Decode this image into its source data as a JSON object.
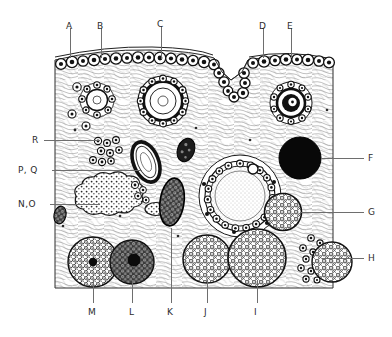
{
  "figure": {
    "kind": "histology-diagram",
    "title": "",
    "background_color": "#ffffff",
    "ink_color": "#1b1b1b",
    "leader_color": "#6e6e6e",
    "label_color": "#2b2b2b",
    "block": {
      "left": 55,
      "top": 52,
      "right": 333,
      "bottom": 288
    }
  },
  "labels": [
    {
      "id": "A",
      "text": "A",
      "x": 66,
      "y": 21,
      "leader": {
        "type": "v",
        "x": 70,
        "y1": 28,
        "y2": 58
      }
    },
    {
      "id": "B",
      "text": "B",
      "x": 97,
      "y": 21,
      "leader": {
        "type": "v",
        "x": 101,
        "y1": 28,
        "y2": 58
      }
    },
    {
      "id": "C",
      "text": "C",
      "x": 157,
      "y": 19,
      "leader": {
        "type": "v",
        "x": 161,
        "y1": 26,
        "y2": 59
      }
    },
    {
      "id": "D",
      "text": "D",
      "x": 259,
      "y": 21,
      "leader": {
        "type": "v",
        "x": 263,
        "y1": 28,
        "y2": 58
      }
    },
    {
      "id": "E",
      "text": "E",
      "x": 287,
      "y": 21,
      "leader": {
        "type": "v",
        "x": 291,
        "y1": 28,
        "y2": 58
      }
    },
    {
      "id": "F",
      "text": "F",
      "x": 368,
      "y": 153,
      "leader": {
        "type": "h",
        "x1": 321,
        "x2": 364,
        "y": 158
      }
    },
    {
      "id": "G",
      "text": "G",
      "x": 368,
      "y": 207,
      "leader": {
        "type": "h",
        "x1": 300,
        "x2": 364,
        "y": 212
      }
    },
    {
      "id": "H",
      "text": "H",
      "x": 368,
      "y": 253,
      "leader": {
        "type": "h",
        "x1": 322,
        "x2": 364,
        "y": 258
      }
    },
    {
      "id": "I",
      "text": "I",
      "x": 254,
      "y": 308,
      "leader": {
        "type": "v",
        "x": 257,
        "y1": 280,
        "y2": 303
      }
    },
    {
      "id": "J",
      "text": "J",
      "x": 204,
      "y": 308,
      "leader": {
        "type": "v",
        "x": 207,
        "y1": 280,
        "y2": 303
      }
    },
    {
      "id": "K",
      "text": "K",
      "x": 167,
      "y": 308,
      "leader": {
        "type": "v",
        "x": 171,
        "y1": 228,
        "y2": 303
      }
    },
    {
      "id": "L",
      "text": "L",
      "x": 129,
      "y": 308,
      "leader": {
        "type": "v",
        "x": 132,
        "y1": 280,
        "y2": 303
      }
    },
    {
      "id": "M",
      "text": "M",
      "x": 88,
      "y": 308,
      "leader": {
        "type": "v",
        "x": 93,
        "y1": 280,
        "y2": 303
      }
    },
    {
      "id": "N,O",
      "text": "N,O",
      "x": 18,
      "y": 199,
      "leader": {
        "type": "h",
        "x1": 50,
        "x2": 100,
        "y": 204
      }
    },
    {
      "id": "P,Q",
      "text": "P, Q",
      "x": 18,
      "y": 165,
      "leader": {
        "type": "h",
        "x1": 52,
        "x2": 142,
        "y": 170
      }
    },
    {
      "id": "R",
      "text": "R",
      "x": 32,
      "y": 135,
      "leader": {
        "type": "h",
        "x1": 44,
        "x2": 100,
        "y": 140
      }
    }
  ],
  "structures": [
    {
      "key": "A",
      "name": "germinal-surface-epithelium"
    },
    {
      "key": "B",
      "name": "primordial-follicles"
    },
    {
      "key": "C",
      "name": "primary-follicle"
    },
    {
      "key": "D",
      "name": "ovulation-cleft-tunica-albuginea"
    },
    {
      "key": "E",
      "name": "secondary-follicle"
    },
    {
      "key": "F",
      "name": "corpus-albicans-dark-body"
    },
    {
      "key": "G",
      "name": "small-corpus-luteum"
    },
    {
      "key": "H",
      "name": "interstitial-cell-cluster"
    },
    {
      "key": "I",
      "name": "mature-corpus-luteum"
    },
    {
      "key": "J",
      "name": "corpus-luteum"
    },
    {
      "key": "K",
      "name": "atretic-follicle"
    },
    {
      "key": "L",
      "name": "regressing-corpus-luteum"
    },
    {
      "key": "M",
      "name": "corpus-luteum-with-central-clot"
    },
    {
      "key": "N,O",
      "name": "corpus-haemorrhagicum"
    },
    {
      "key": "P,Q",
      "name": "ruptured-follicle-wall"
    },
    {
      "key": "R",
      "name": "follicle-cell-nests"
    }
  ]
}
